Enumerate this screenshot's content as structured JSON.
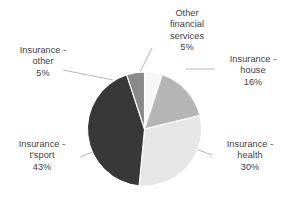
{
  "chart_data": {
    "type": "pie",
    "title": "",
    "subtitle": "",
    "xlabel": "",
    "ylabel": "",
    "grid": false,
    "legend_position": "none",
    "label_style": "outside-with-leader-lines",
    "start_angle_deg": 0,
    "direction": "clockwise",
    "units": "percent",
    "categories": [
      "Other financial services",
      "Insurance - house",
      "Insurance - health",
      "Insurance - t'sport",
      "Insurance - other"
    ],
    "values": [
      5,
      16,
      30,
      43,
      5
    ],
    "colors": [
      "#f7f7f7",
      "#b5b5b5",
      "#e6e6e6",
      "#383838",
      "#8a8a8a"
    ],
    "slices": [
      {
        "name": "Other financial services",
        "value": 5,
        "value_text": "5%",
        "color": "#f7f7f7",
        "label_lines": [
          "Other",
          "financial",
          "services"
        ]
      },
      {
        "name": "Insurance - house",
        "value": 16,
        "value_text": "16%",
        "color": "#b5b5b5",
        "label_lines": [
          "Insurance -",
          "house"
        ]
      },
      {
        "name": "Insurance - health",
        "value": 30,
        "value_text": "30%",
        "color": "#e6e6e6",
        "label_lines": [
          "Insurance -",
          "health"
        ]
      },
      {
        "name": "Insurance - t'sport",
        "value": 43,
        "value_text": "43%",
        "color": "#383838",
        "label_lines": [
          "Insurance -",
          "t'sport"
        ]
      },
      {
        "name": "Insurance - other",
        "value": 5,
        "value_text": "5%",
        "color": "#8a8a8a",
        "label_lines": [
          "Insurance -",
          "other"
        ]
      }
    ]
  },
  "labels": {
    "other_financial_services": {
      "line1": "Other",
      "line2": "financial",
      "line3": "services",
      "pct": "5%"
    },
    "insurance_house": {
      "line1": "Insurance -",
      "line2": "house",
      "pct": "16%"
    },
    "insurance_health": {
      "line1": "Insurance -",
      "line2": "health",
      "pct": "30%"
    },
    "insurance_tsport": {
      "line1": "Insurance -",
      "line2": "t'sport",
      "pct": "43%"
    },
    "insurance_other": {
      "line1": "Insurance -",
      "line2": "other",
      "pct": "5%"
    }
  },
  "style": {
    "background": "#ffffff",
    "text_color": "#404040",
    "leader_line_color": "#9a9a9a"
  }
}
